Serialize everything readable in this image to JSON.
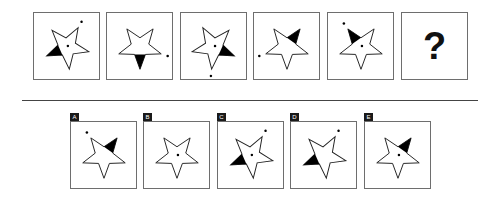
{
  "puzzle": {
    "question_symbol": "?",
    "sequence": [
      {
        "filled_tip": "left",
        "center_dot": true,
        "outer_dot": "upper-right",
        "rotation": -6
      },
      {
        "filled_tip": "bottom",
        "center_dot": false,
        "outer_dot": "right",
        "rotation": 0
      },
      {
        "filled_tip": "right",
        "center_dot": true,
        "outer_dot": "bottom",
        "rotation": 6
      },
      {
        "filled_tip": "upper-right",
        "center_dot": false,
        "outer_dot": "left",
        "rotation": 0
      },
      {
        "filled_tip": "upper-left",
        "center_dot": true,
        "outer_dot": "upper-left",
        "rotation": 0
      }
    ],
    "options": [
      {
        "label": "A",
        "filled_tip": "upper-right",
        "center_dot": false,
        "outer_dot": "upper-left",
        "rotation": 0
      },
      {
        "label": "B",
        "filled_tip": "none",
        "center_dot": true,
        "outer_dot": "none",
        "rotation": 0
      },
      {
        "label": "C",
        "filled_tip": "left",
        "center_dot": true,
        "outer_dot": "upper-right",
        "rotation": -6
      },
      {
        "label": "D",
        "filled_tip": "left",
        "center_dot": false,
        "outer_dot": "upper-right",
        "rotation": -6
      },
      {
        "label": "E",
        "filled_tip": "upper-right",
        "center_dot": true,
        "outer_dot": "none",
        "rotation": 0
      }
    ]
  },
  "colors": {
    "stroke": "#222222",
    "fill": "#000000",
    "border": "#6e6e6e"
  }
}
